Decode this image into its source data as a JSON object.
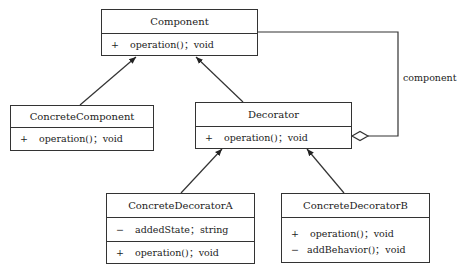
{
  "classes": {
    "component": {
      "name": "Component",
      "operations": [
        {
          "visibility": "+",
          "text": "operation()；void"
        }
      ]
    },
    "concrete_component": {
      "name": "ConcreteComponent",
      "operations": [
        {
          "visibility": "+",
          "text": "operation()；void"
        }
      ]
    },
    "decorator": {
      "name": "Decorator",
      "operations": [
        {
          "visibility": "+",
          "text": "operation()；void"
        }
      ]
    },
    "concrete_decorator_a": {
      "name": "ConcreteDecoratorA",
      "attributes": [
        {
          "visibility": "−",
          "text": "addedState；string"
        }
      ],
      "operations": [
        {
          "visibility": "+",
          "text": "operation()；void"
        }
      ]
    },
    "concrete_decorator_b": {
      "name": "ConcreteDecoratorB",
      "operations": [
        {
          "visibility": "+",
          "text": "operation()；void"
        },
        {
          "visibility": "−",
          "text": "addBehavior()；void"
        }
      ]
    }
  },
  "relations": {
    "aggregation_label": "component"
  }
}
